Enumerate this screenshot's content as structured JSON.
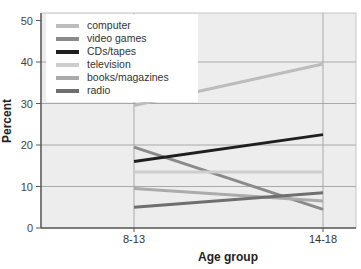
{
  "figure": {
    "background": "#ffffff",
    "plot_background": "#ededed",
    "frame_color": "#c6c6c6",
    "axis_color": "#5a5a5a",
    "grid_color": "#a8a8a8",
    "legend_background": "#ffffff"
  },
  "chart_data": {
    "type": "line",
    "title": "",
    "xlabel": "Age group",
    "ylabel": "Percent",
    "categories": [
      "8-13",
      "14-18"
    ],
    "yticks": [
      0,
      10,
      20,
      30,
      40,
      50
    ],
    "ylim": [
      0,
      50
    ],
    "grid": true,
    "legend_position": "top-left",
    "series": [
      {
        "name": "computer",
        "color": "#bcbcbc",
        "values": [
          29.5,
          39.5
        ]
      },
      {
        "name": "video games",
        "color": "#8a8a8a",
        "values": [
          19.5,
          4.5
        ]
      },
      {
        "name": "CDs/tapes",
        "color": "#1f1f1f",
        "values": [
          16.0,
          22.5
        ]
      },
      {
        "name": "television",
        "color": "#cdcdcd",
        "values": [
          13.5,
          13.5
        ]
      },
      {
        "name": "books/magazines",
        "color": "#ababab",
        "values": [
          9.5,
          6.5
        ]
      },
      {
        "name": "radio",
        "color": "#6f6f6f",
        "values": [
          5.0,
          8.5
        ]
      }
    ]
  }
}
